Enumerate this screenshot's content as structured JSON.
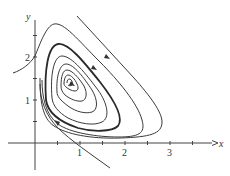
{
  "figure": {
    "type": "phase-portrait",
    "axes": {
      "x_label": "x",
      "y_label": "y",
      "x_ticks": [
        {
          "value": 0.5,
          "label": ""
        },
        {
          "value": 1,
          "label": "1"
        },
        {
          "value": 1.5,
          "label": ""
        },
        {
          "value": 2,
          "label": "2"
        },
        {
          "value": 2.5,
          "label": ""
        },
        {
          "value": 3,
          "label": "3"
        },
        {
          "value": 3.5,
          "label": ""
        }
      ],
      "y_ticks": [
        {
          "value": 0.5,
          "label": ""
        },
        {
          "value": 1,
          "label": "1"
        },
        {
          "value": 1.5,
          "label": ""
        },
        {
          "value": 2,
          "label": "2"
        },
        {
          "value": 2.5,
          "label": ""
        }
      ],
      "x_range": [
        -0.6,
        4
      ],
      "y_range": [
        -0.6,
        3.3
      ]
    },
    "labels": {
      "x_axis": "x",
      "y_axis": "y",
      "tick_x1": "1",
      "tick_x2": "2",
      "tick_x3": "3",
      "tick_y1": "1",
      "tick_y2": "2"
    },
    "colors": {
      "background": "#ffffff",
      "curve": "#3a3a3a",
      "axis": "#444444"
    }
  }
}
